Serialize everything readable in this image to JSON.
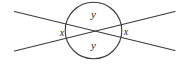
{
  "figure": {
    "background_color": "#ffffff",
    "stroke_color": "#3a3a3a",
    "label_color": "#1b1b1b",
    "stroke_width": 1.1,
    "canvas": {
      "width": 187,
      "height": 64
    },
    "circle": {
      "name": "angle-circle",
      "cx": 93.5,
      "cy": 30.5,
      "r": 28.3,
      "fill": "none"
    },
    "vertex": {
      "x": 93.5,
      "y": 30.8
    },
    "lines": [
      {
        "name": "line-nw-se",
        "x1": 14.5,
        "y1": 11.5,
        "x2": 175.0,
        "y2": 50.5
      },
      {
        "name": "line-sw-ne",
        "x1": 14.5,
        "y1": 51.0,
        "x2": 175.0,
        "y2": 11.5
      }
    ],
    "labels": [
      {
        "name": "label-y-top",
        "text": "y",
        "x": 93.5,
        "y": 15.0,
        "size": 11
      },
      {
        "name": "label-y-bottom",
        "text": "y",
        "x": 93.5,
        "y": 46.5,
        "size": 11
      },
      {
        "name": "label-x-left",
        "text": "x",
        "x": 62.0,
        "y": 33.5,
        "size": 10
      },
      {
        "name": "label-x-right",
        "text": "x",
        "x": 126.0,
        "y": 33.0,
        "size": 10
      }
    ]
  }
}
